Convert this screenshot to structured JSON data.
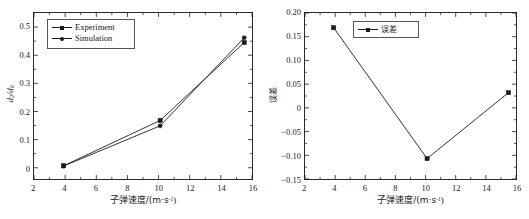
{
  "figure": {
    "background": "#ffffff",
    "line_color": "#1a1a1a",
    "axis_color": "#2b2b2b"
  },
  "chart_data": [
    {
      "id": "left",
      "type": "line",
      "title": "",
      "xlabel": "子弹速度/(m·s⁻¹)",
      "ylabel": "d₂/d₀",
      "xlim": [
        2,
        16
      ],
      "ylim": [
        -0.04,
        0.55
      ],
      "xticks": [
        2,
        4,
        6,
        8,
        10,
        12,
        14,
        16
      ],
      "yticks": [
        0,
        0.1,
        0.2,
        0.3,
        0.4,
        0.5
      ],
      "xtick_labels": [
        "2",
        "4",
        "6",
        "8",
        "10",
        "12",
        "14",
        "16"
      ],
      "ytick_labels": [
        "0",
        "0.1",
        "0.2",
        "0.3",
        "0.4",
        "0.5"
      ],
      "grid": false,
      "legend_position": "upper-left",
      "x": [
        3.9,
        10.1,
        15.5
      ],
      "series": [
        {
          "name": "Experiment",
          "marker": "square",
          "values": [
            0.007,
            0.168,
            0.445
          ]
        },
        {
          "name": "Simulation",
          "marker": "circle",
          "values": [
            0.006,
            0.149,
            0.462
          ]
        }
      ]
    },
    {
      "id": "right",
      "type": "line",
      "title": "",
      "xlabel": "子弹速度/(m·s⁻¹)",
      "ylabel": "误差",
      "xlim": [
        2,
        16
      ],
      "ylim": [
        -0.15,
        0.2
      ],
      "xticks": [
        2,
        4,
        6,
        8,
        10,
        12,
        14,
        16
      ],
      "yticks": [
        -0.15,
        -0.1,
        -0.05,
        0,
        0.05,
        0.1,
        0.15,
        0.2
      ],
      "xtick_labels": [
        "2",
        "4",
        "6",
        "8",
        "10",
        "12",
        "14",
        "16"
      ],
      "ytick_labels": [
        "−0.15",
        "−0.10",
        "−0.05",
        "0",
        "0.05",
        "0.10",
        "0.15",
        "0.20"
      ],
      "grid": false,
      "legend_position": "upper-center",
      "x": [
        3.9,
        10.1,
        15.5
      ],
      "series": [
        {
          "name": "误差",
          "marker": "square",
          "values": [
            0.169,
            -0.107,
            0.032
          ]
        }
      ]
    }
  ],
  "legends": {
    "left": [
      {
        "label": "Experiment",
        "marker": "square"
      },
      {
        "label": "Simulation",
        "marker": "circle"
      }
    ],
    "right": [
      {
        "label": "误差",
        "marker": "square"
      }
    ]
  },
  "labels": {
    "left_xaxis_prefix": "子弹速度/(m·s",
    "left_xaxis_exp": "-1",
    "left_xaxis_suffix": ")",
    "left_yaxis_num": "d",
    "left_yaxis_num_sub": "2",
    "left_yaxis_den": "d",
    "left_yaxis_den_sub": "0",
    "right_yaxis": "误差"
  }
}
